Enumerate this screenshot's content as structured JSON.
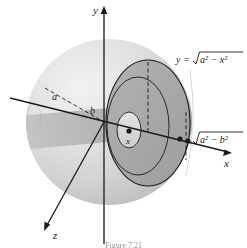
{
  "figure": {
    "caption": "Figure 7.21",
    "axes": {
      "y_label": "y",
      "x_label": "x",
      "z_label": "z"
    },
    "labels": {
      "radius_a": "a",
      "radius_b": "b",
      "slice_x": "x",
      "curve_equation": "y =",
      "curve_radicand": "a² − x²",
      "half_length": "",
      "half_length_radicand": "a² − b²"
    },
    "colors": {
      "sphere_light": "#e3e3e3",
      "sphere_mid": "#d2d2d2",
      "sphere_shadow": "#bdbdbd",
      "hole_band": "#b8b8b8",
      "washer_fill": "#a9a9a9",
      "inner_hole_fill": "#d8d8d8",
      "stroke": "#1a1a1a",
      "background": "#ffffff"
    }
  }
}
